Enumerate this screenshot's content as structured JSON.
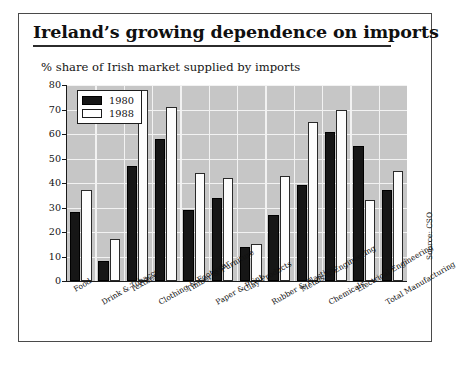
{
  "figure": {
    "title": "Ireland’s growing dependence on imports",
    "subtitle": "% share of Irish market supplied by imports",
    "source": "Source: CSO"
  },
  "legend": {
    "position": "top-left",
    "entries": [
      {
        "label": "1980",
        "color": "#161616"
      },
      {
        "label": "1988",
        "color": "#ffffff"
      }
    ]
  },
  "chart_data": {
    "type": "bar",
    "title": "Ireland’s growing dependence on imports",
    "subtitle": "% share of Irish market supplied by imports",
    "xlabel": "",
    "ylabel": "% share of Irish market supplied by imports",
    "ylim": [
      0,
      80
    ],
    "yticks": [
      0,
      10,
      20,
      30,
      40,
      50,
      60,
      70,
      80
    ],
    "grid": true,
    "legend_position": "top-left",
    "categories": [
      "Food",
      "Drink & Tobacco",
      "Textiles",
      "Clothing & Footwear",
      "Timber & Furniture",
      "Paper & Print",
      "Clay Products",
      "Rubber & Plastics",
      "Metals & Engineering",
      "Chemicals",
      "Electrical Engineering",
      "Total Manufacturing"
    ],
    "series": [
      {
        "name": "1980",
        "color": "#161616",
        "values": [
          28,
          8,
          47,
          58,
          29,
          34,
          14,
          27,
          39,
          61,
          55,
          37
        ]
      },
      {
        "name": "1988",
        "color": "#ffffff",
        "values": [
          37,
          17,
          78,
          71,
          44,
          42,
          15,
          43,
          65,
          70,
          33,
          45
        ]
      }
    ]
  }
}
